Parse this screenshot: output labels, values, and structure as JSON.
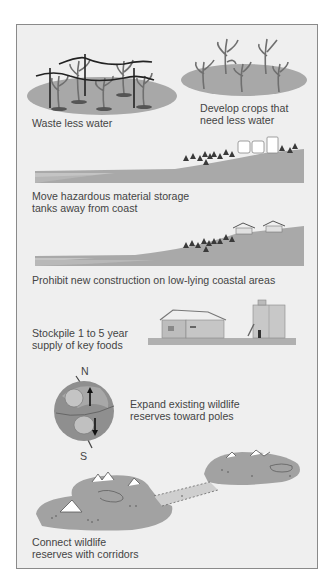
{
  "figure": {
    "panels": [
      {
        "id": "waste-less-water",
        "caption_lines": [
          "Waste less water"
        ]
      },
      {
        "id": "develop-crops",
        "caption_lines": [
          "Develop crops that",
          "need less water"
        ]
      },
      {
        "id": "move-tanks",
        "caption_lines": [
          "Move hazardous material storage",
          "tanks away from coast"
        ]
      },
      {
        "id": "prohibit-construction",
        "caption_lines": [
          "Prohibit new construction on low-lying coastal areas"
        ]
      },
      {
        "id": "stockpile-food",
        "caption_lines": [
          "Stockpile 1 to 5 year",
          "supply of key foods"
        ]
      },
      {
        "id": "expand-reserves",
        "caption_lines": [
          "Expand existing wildlife",
          "reserves toward poles"
        ],
        "globe_labels": {
          "north": "N",
          "south": "S"
        }
      },
      {
        "id": "connect-reserves",
        "caption_lines": [
          "Connect wildlife",
          "reserves with corridors"
        ]
      }
    ],
    "colors": {
      "panel_bg": "#efefef",
      "border": "#8a8a8a",
      "ground": "#a9a9a9",
      "land": "#9e9e9e",
      "text": "#444444"
    }
  }
}
